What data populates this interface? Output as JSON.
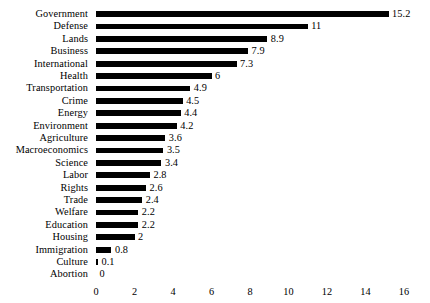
{
  "chart_data": {
    "type": "bar",
    "orientation": "horizontal",
    "title": "",
    "subtitle": "",
    "xlabel": "",
    "ylabel": "",
    "xlim": [
      0,
      16
    ],
    "xticks": [
      0,
      2,
      4,
      6,
      8,
      10,
      12,
      14,
      16
    ],
    "xtick_labels": [
      "0",
      "2",
      "4",
      "6",
      "8",
      "10",
      "12",
      "14",
      "16"
    ],
    "grid": false,
    "legend": false,
    "bar_color": "#000000",
    "background_color": "#ffffff",
    "value_labels_shown": true,
    "categories": [
      "Government",
      "Defense",
      "Lands",
      "Business",
      "International",
      "Health",
      "Transportation",
      "Crime",
      "Energy",
      "Environment",
      "Agriculture",
      "Macroeconomics",
      "Science",
      "Labor",
      "Rights",
      "Trade",
      "Welfare",
      "Education",
      "Housing",
      "Immigration",
      "Culture",
      "Abortion"
    ],
    "values": [
      15.2,
      11,
      8.9,
      7.9,
      7.3,
      6,
      4.9,
      4.5,
      4.4,
      4.2,
      3.6,
      3.5,
      3.4,
      2.8,
      2.6,
      2.4,
      2.2,
      2.2,
      2,
      0.8,
      0.1,
      0
    ],
    "value_labels": [
      "15.2",
      "11",
      "8.9",
      "7.9",
      "7.3",
      "6",
      "4.9",
      "4.5",
      "4.4",
      "4.2",
      "3.6",
      "3.5",
      "3.4",
      "2.8",
      "2.6",
      "2.4",
      "2.2",
      "2.2",
      "2",
      "0.8",
      "0.1",
      "0"
    ]
  }
}
